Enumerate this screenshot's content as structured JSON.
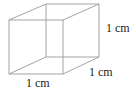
{
  "figure": {
    "type": "cube",
    "stroke_color": "#9a9a9a",
    "labels": {
      "height": "1 cm",
      "depth": "1 cm",
      "width": "1 cm"
    },
    "vertices": {
      "front_top_left": [
        9,
        20
      ],
      "front_top_right": [
        63,
        20
      ],
      "front_bottom_left": [
        9,
        74
      ],
      "front_bottom_right": [
        63,
        74
      ],
      "back_top_left": [
        46,
        4
      ],
      "back_top_right": [
        99,
        4
      ],
      "back_bottom_left": [
        46,
        57
      ],
      "back_bottom_right": [
        99,
        57
      ]
    }
  }
}
